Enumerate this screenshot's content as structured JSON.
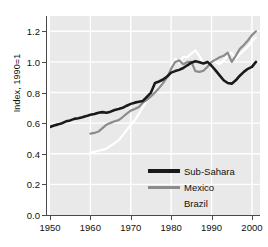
{
  "chart_data": {
    "type": "line",
    "title": "",
    "xlabel": "",
    "ylabel": "Index, 1990=1",
    "xlim": [
      1950,
      2002
    ],
    "ylim": [
      0.0,
      1.3
    ],
    "grid": true,
    "grid_color": "#ffffff",
    "panel_color": "#e9e9e9",
    "legend_position": "bottom-right",
    "xticks": [
      1950,
      1960,
      1970,
      1980,
      1990,
      2000
    ],
    "xticklabels": [
      "1950",
      "1960",
      "1970",
      "1980",
      "1990",
      "2000"
    ],
    "yticks": [
      0.0,
      0.2,
      0.4,
      0.6,
      0.8,
      1.0,
      1.2
    ],
    "yticklabels": [
      "0.0",
      "0.2",
      "0.4",
      "0.6",
      "0.8",
      "1.0",
      "1.2"
    ],
    "series": [
      {
        "name": "Sub-Sahara",
        "color": "#1a1a1a",
        "width": 2.6,
        "x": [
          1950,
          1951,
          1952,
          1953,
          1954,
          1955,
          1956,
          1957,
          1958,
          1959,
          1960,
          1961,
          1962,
          1963,
          1964,
          1965,
          1966,
          1967,
          1968,
          1969,
          1970,
          1971,
          1972,
          1973,
          1974,
          1975,
          1976,
          1977,
          1978,
          1979,
          1980,
          1981,
          1982,
          1983,
          1984,
          1985,
          1986,
          1987,
          1988,
          1989,
          1990,
          1991,
          1992,
          1993,
          1994,
          1995,
          1996,
          1997,
          1998,
          1999,
          2000,
          2001
        ],
        "values": [
          0.575,
          0.585,
          0.592,
          0.6,
          0.612,
          0.618,
          0.628,
          0.632,
          0.638,
          0.646,
          0.655,
          0.66,
          0.668,
          0.672,
          0.668,
          0.675,
          0.686,
          0.692,
          0.7,
          0.714,
          0.726,
          0.734,
          0.74,
          0.745,
          0.772,
          0.8,
          0.862,
          0.872,
          0.885,
          0.905,
          0.93,
          0.94,
          0.948,
          0.96,
          0.978,
          0.995,
          1.005,
          0.998,
          0.99,
          1.0,
          0.975,
          0.945,
          0.912,
          0.88,
          0.862,
          0.858,
          0.88,
          0.91,
          0.935,
          0.955,
          0.968,
          1.0
        ],
        "note_segment": "primary dark line spans 1950-2001, with a late rise to ~1.23"
      },
      {
        "name": "Mexico",
        "color": "#8c8c8c",
        "width": 2.2,
        "x": [
          1960,
          1961,
          1962,
          1963,
          1964,
          1965,
          1966,
          1967,
          1968,
          1969,
          1970,
          1971,
          1972,
          1973,
          1974,
          1975,
          1976,
          1977,
          1978,
          1979,
          1980,
          1981,
          1982,
          1983,
          1984,
          1985,
          1986,
          1987,
          1988,
          1989,
          1990,
          1991,
          1992,
          1993,
          1994,
          1995,
          1996,
          1997,
          1998,
          1999,
          2000,
          2001
        ],
        "values": [
          0.532,
          0.536,
          0.545,
          0.568,
          0.59,
          0.602,
          0.612,
          0.62,
          0.64,
          0.662,
          0.682,
          0.692,
          0.705,
          0.735,
          0.752,
          0.775,
          0.8,
          0.83,
          0.862,
          0.9,
          0.955,
          1.0,
          1.01,
          0.985,
          1.0,
          1.0,
          0.94,
          0.935,
          0.942,
          0.968,
          1.0,
          1.015,
          1.03,
          1.04,
          1.06,
          1.0,
          1.04,
          1.085,
          1.11,
          1.14,
          1.175,
          1.2
        ]
      },
      {
        "name": "Brazil",
        "color": "#ffffff",
        "width": 2.2,
        "x": [
          1960,
          1961,
          1962,
          1963,
          1964,
          1965,
          1966,
          1967,
          1968,
          1969,
          1970,
          1971,
          1972,
          1973,
          1974,
          1975,
          1976,
          1977,
          1978,
          1979,
          1980,
          1981,
          1982,
          1983,
          1984,
          1985,
          1986,
          1987,
          1988,
          1989,
          1990,
          1991,
          1992,
          1993,
          1994,
          1995,
          1996,
          1997,
          1998,
          1999,
          2000,
          2001
        ],
        "values": [
          0.41,
          0.412,
          0.42,
          0.425,
          0.435,
          0.452,
          0.47,
          0.488,
          0.52,
          0.555,
          0.588,
          0.62,
          0.66,
          0.705,
          0.745,
          0.772,
          0.81,
          0.84,
          0.875,
          0.905,
          0.955,
          1.02,
          0.995,
          1.035,
          1.03,
          1.055,
          1.075,
          1.04,
          0.985,
          1.0,
          1.0,
          1.0,
          0.985,
          1.01,
          1.04,
          1.06,
          1.02,
          1.05,
          1.075,
          1.1,
          1.135,
          1.16
        ]
      }
    ]
  },
  "legend": {
    "items": [
      {
        "label": "Sub-Sahara",
        "color": "#1a1a1a",
        "thickness": 4,
        "show_swatch": true
      },
      {
        "label": "Mexico",
        "color": "#8c8c8c",
        "thickness": 3,
        "show_swatch": true
      },
      {
        "label": "Brazil",
        "color": "#ffffff",
        "thickness": 3,
        "show_swatch": false
      }
    ]
  }
}
